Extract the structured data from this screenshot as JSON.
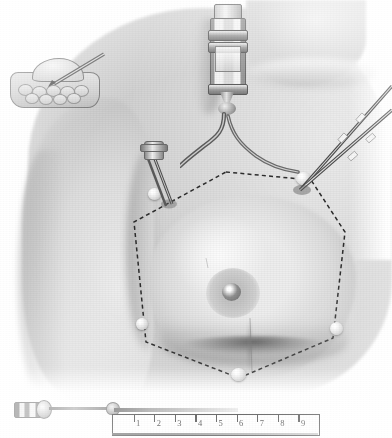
{
  "plate": {
    "title": "Breast infiltration anesthesia technique",
    "background_color": "#ffffff",
    "ink_color": "#2e2e2e",
    "skin_tone": "#dcdcdc",
    "style": "halftone medical illustration, grayscale"
  },
  "inset": {
    "name": "breast cross-section inset",
    "caption": "",
    "description": "sagittal section of breast with needle entering subcutaneous plane"
  },
  "figure": {
    "field_outline": {
      "name": "hexagonal dashed infiltration field",
      "shape": "hexagon",
      "stroke_style": "dashed"
    },
    "nipple": "nipple",
    "areola": "areola"
  },
  "instruments": {
    "syringe": {
      "name": "glass barrel syringe",
      "position": "supraclavicular chest"
    },
    "cannulas": [
      {
        "name": "upper cannula",
        "entry": "upper outer quadrant"
      },
      {
        "name": "lower cannula",
        "entry": "upper outer quadrant"
      }
    ],
    "needle_hub": {
      "name": "needle hub",
      "entry": "upper inner quadrant"
    }
  },
  "injection_sites": [
    {
      "label": "site-upper-inner"
    },
    {
      "label": "site-upper-outer"
    },
    {
      "label": "site-lateral-left"
    },
    {
      "label": "site-lateral-right"
    },
    {
      "label": "site-inferior"
    }
  ],
  "bottom_instrument": {
    "name": "long infiltration needle with scale",
    "hub_label": "",
    "ruler": {
      "name": "centimetre scale",
      "unit": "",
      "ticks": [
        "1",
        "2",
        "3",
        "4",
        "5",
        "6",
        "7",
        "8",
        "9"
      ]
    }
  }
}
